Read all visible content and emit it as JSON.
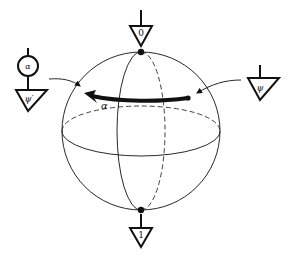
{
  "diagram": {
    "colors": {
      "stroke": "#111111",
      "background": "#ffffff"
    },
    "sphere": {
      "center": [
        141,
        131
      ],
      "radius": 79,
      "north_label": "0",
      "south_label": "1"
    },
    "rotation": {
      "label": "α",
      "direction": "right-to-left"
    },
    "left_gadget": {
      "gate_label": "α",
      "state_label": "ψ′"
    },
    "right_gadget": {
      "state_label": "ψ"
    },
    "top_effect": {
      "label": "0"
    },
    "bottom_effect": {
      "label": "1"
    }
  }
}
